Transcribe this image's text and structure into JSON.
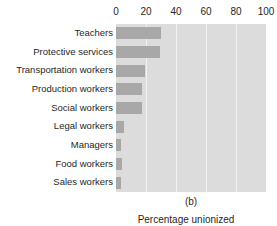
{
  "figure": {
    "caption": "(b)",
    "top_artifact": "· · · ·        ·      ·      ·"
  },
  "chart_data": {
    "type": "bar",
    "orientation": "horizontal",
    "title": "",
    "subtitle": "",
    "xlabel": "Percentage unionized",
    "ylabel": "",
    "categories": [
      "Teachers",
      "Protective services",
      "Transportation workers",
      "Production workers",
      "Social workers",
      "Legal workers",
      "Managers",
      "Food workers",
      "Sales workers"
    ],
    "values": [
      30,
      29,
      19,
      17.5,
      17.5,
      5.5,
      3.5,
      4,
      3.5
    ],
    "xlim": [
      0,
      100
    ],
    "xticks": [
      0,
      20,
      40,
      60,
      80,
      100
    ],
    "xtick_labels": [
      "0",
      "20",
      "40",
      "60",
      "80",
      "100"
    ],
    "grid": true,
    "grid_axis": "x",
    "legend": null,
    "legend_position": "none",
    "colors": {
      "bar": "#a8a8a8",
      "plot_background": "#dcdcdc",
      "gridline": "#f2f2f2",
      "text": "#1f1f1f",
      "page_background": "#ffffff"
    }
  }
}
